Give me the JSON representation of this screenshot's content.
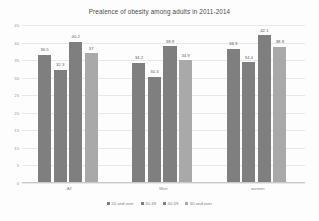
{
  "chart_data": {
    "type": "bar",
    "title": "Prealence of obesity among adults in 2011-2014",
    "xlabel": "",
    "ylabel": "",
    "categories": [
      "All",
      "Men",
      "women"
    ],
    "series": [
      {
        "name": "20 and over",
        "color": "#7f7f7f",
        "values": [
          36.5,
          34.2,
          38.3
        ]
      },
      {
        "name": "20-39",
        "color": "#7f7f7f",
        "values": [
          32.3,
          30.3,
          34.4
        ]
      },
      {
        "name": "40-59",
        "color": "#7f7f7f",
        "values": [
          40.2,
          38.9,
          42.1
        ]
      },
      {
        "name": "60 and over",
        "color": "#a9a9a9",
        "values": [
          37.0,
          34.9,
          38.8
        ]
      }
    ],
    "value_labels": [
      [
        "36.5",
        "32.3",
        "40.2",
        "37"
      ],
      [
        "34.2",
        "30.3",
        "38.9",
        "34.9"
      ],
      [
        "38.3",
        "34.4",
        "42.1",
        "38.8"
      ]
    ],
    "ylim": [
      0,
      45
    ],
    "ytick_labels": [
      "0",
      "5",
      "10",
      "15",
      "20",
      "25",
      "30",
      "35",
      "40",
      "45"
    ],
    "ytick_values": [
      0,
      5,
      10,
      15,
      20,
      25,
      30,
      35,
      40,
      45
    ],
    "grid": true,
    "legend_position": "bottom"
  }
}
